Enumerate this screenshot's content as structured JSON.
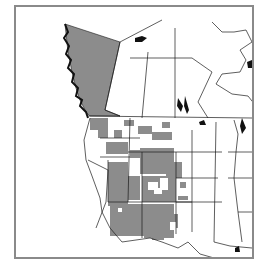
{
  "map": {
    "region": "Western North America",
    "frame_color": "#8a8a8a",
    "colors": {
      "shaded_range": "#8c8c8c",
      "boundary_line": "#1a1a1a",
      "water_features": "#111111",
      "background": "#ffffff"
    },
    "shaded_areas": [
      "British Columbia",
      "Washington (partial)",
      "Oregon (partial)",
      "Idaho (partial)",
      "Montana (partial)",
      "Nevada",
      "Utah",
      "Wyoming (partial)",
      "Colorado (partial)",
      "Arizona",
      "New Mexico",
      "West Texas (partial)"
    ],
    "labels": []
  }
}
